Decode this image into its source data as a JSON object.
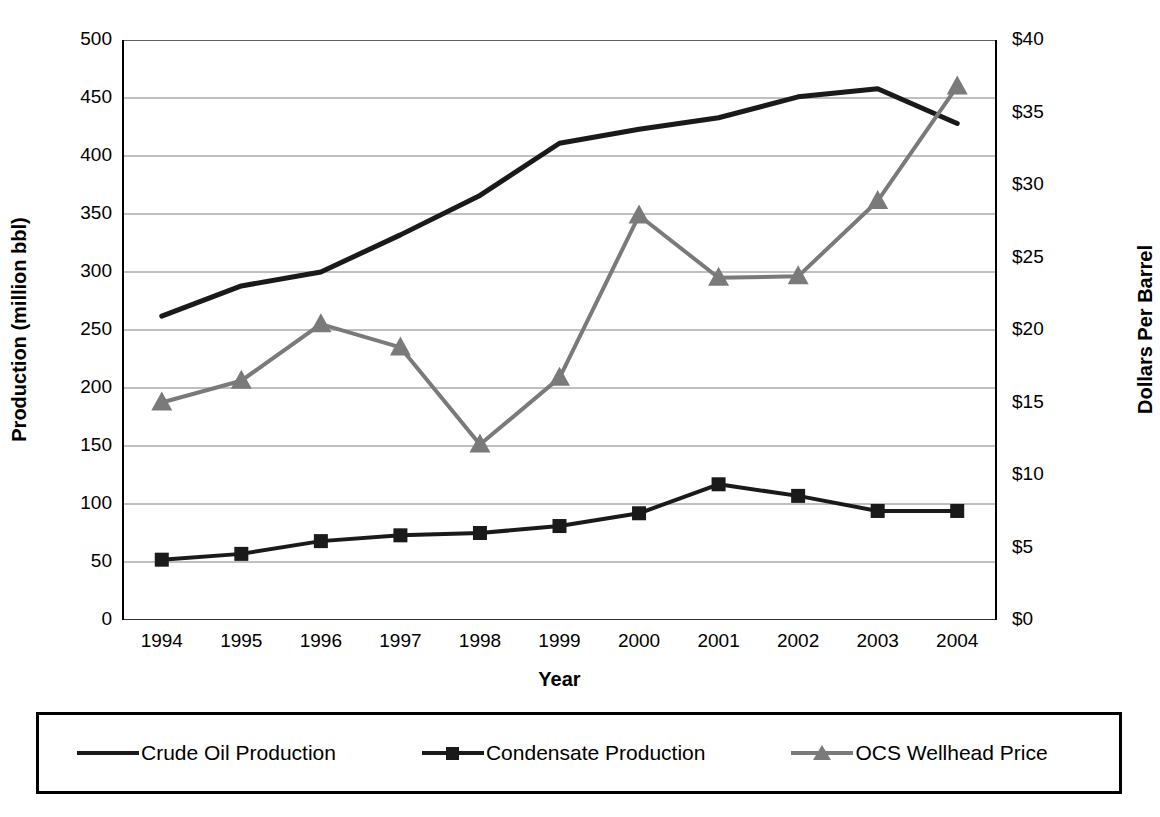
{
  "chart_data": {
    "type": "line",
    "title": "",
    "xlabel": "Year",
    "ylabel": "Production (million bbl)",
    "ylabel_right": "Dollars Per Barrel",
    "categories": [
      "1994",
      "1995",
      "1996",
      "1997",
      "1998",
      "1999",
      "2000",
      "2001",
      "2002",
      "2003",
      "2004"
    ],
    "ylim": [
      0,
      500
    ],
    "ylim_right": [
      0,
      40
    ],
    "yticks": [
      "0",
      "50",
      "100",
      "150",
      "200",
      "250",
      "300",
      "350",
      "400",
      "450",
      "500"
    ],
    "yticks_right": [
      "$0",
      "$5",
      "$10",
      "$15",
      "$20",
      "$25",
      "$30",
      "$35",
      "$40"
    ],
    "grid": true,
    "legend_position": "bottom",
    "series": [
      {
        "name": "Crude Oil Production",
        "axis": "left",
        "marker": "none",
        "color": "#1a1a1a",
        "values": [
          262,
          288,
          300,
          332,
          366,
          411,
          423,
          433,
          451,
          458,
          428
        ]
      },
      {
        "name": "Condensate Production",
        "axis": "left",
        "marker": "square",
        "color": "#1a1a1a",
        "values": [
          52,
          57,
          68,
          73,
          75,
          81,
          92,
          117,
          107,
          94,
          94
        ]
      },
      {
        "name": "OCS Wellhead Price",
        "axis": "right",
        "marker": "triangle",
        "color": "#7a7a7a",
        "values": [
          15.0,
          16.5,
          20.4,
          18.8,
          12.1,
          16.7,
          27.9,
          23.6,
          23.7,
          28.9,
          36.8
        ]
      }
    ]
  },
  "legend": {
    "items": [
      {
        "label": "Crude Oil Production",
        "marker": "line",
        "color": "#1a1a1a"
      },
      {
        "label": "Condensate Production",
        "marker": "square",
        "color": "#1a1a1a"
      },
      {
        "label": "OCS Wellhead Price",
        "marker": "triangle",
        "color": "#7a7a7a"
      }
    ]
  }
}
